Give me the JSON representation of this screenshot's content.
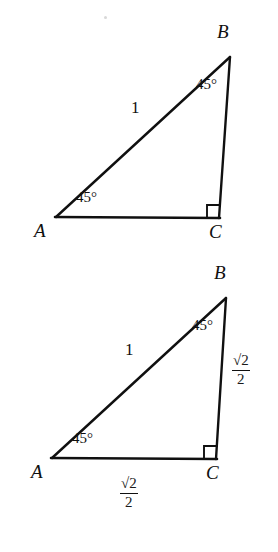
{
  "figure_set": {
    "background_color": "#ffffff",
    "stroke_color": "#101010",
    "figures": [
      {
        "id": "triangle-unit-hypotenuse",
        "description": "45-45-90 right triangle ABC with right angle at C and hypotenuse AB labeled 1",
        "vertices": {
          "A": {
            "label": "A",
            "x": 56,
            "y": 217
          },
          "B": {
            "label": "B",
            "x": 230,
            "y": 57
          },
          "C": {
            "label": "C",
            "x": 219,
            "y": 217
          }
        },
        "angle_labels": {
          "at_A": "45°",
          "at_B": "45°",
          "at_C": "right-angle-square"
        },
        "side_labels": {
          "AB": "1",
          "BC": "",
          "AC": ""
        }
      },
      {
        "id": "triangle-legs-labeled",
        "description": "Same 45-45-90 right triangle ABC with both legs labeled square root of 2 over 2",
        "vertices": {
          "A": {
            "label": "A",
            "x": 52,
            "y": 458
          },
          "B": {
            "label": "B",
            "x": 226,
            "y": 298
          },
          "C": {
            "label": "C",
            "x": 216,
            "y": 458
          }
        },
        "angle_labels": {
          "at_A": "45°",
          "at_B": "45°",
          "at_C": "right-angle-square"
        },
        "side_labels": {
          "AB": "1",
          "BC": {
            "numerator": "√2",
            "denominator": "2"
          },
          "AC": {
            "numerator": "√2",
            "denominator": "2"
          }
        }
      }
    ]
  }
}
